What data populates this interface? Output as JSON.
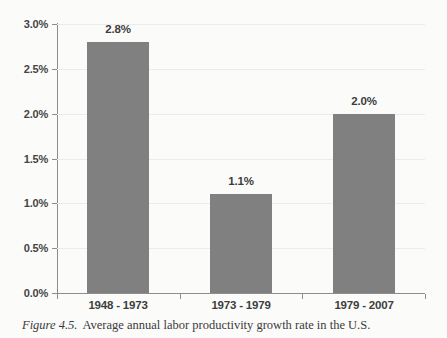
{
  "chart_data": {
    "type": "bar",
    "title": "",
    "xlabel": "",
    "ylabel": "",
    "categories": [
      "1948 - 1973",
      "1973 - 1979",
      "1979 - 2007"
    ],
    "values": [
      2.8,
      1.1,
      2.0
    ],
    "value_labels": [
      "2.8%",
      "1.1%",
      "2.0%"
    ],
    "ylim": [
      0.0,
      3.0
    ],
    "ytick_values": [
      3.0,
      2.5,
      2.0,
      1.5,
      1.0,
      0.5,
      0.0
    ],
    "ytick_labels": [
      "3.0%",
      "2.5%",
      "2.0%",
      "1.5%",
      "1.0%",
      "0.5%",
      "0.0%"
    ],
    "grid": true,
    "legend": false,
    "bar_color": "#808080",
    "gridline_color": "#ebebeb",
    "axis_color": "#8d8d8d"
  },
  "caption": {
    "number": "Figure 4.5.",
    "text": "Average annual labor productivity growth rate in the U.S."
  }
}
